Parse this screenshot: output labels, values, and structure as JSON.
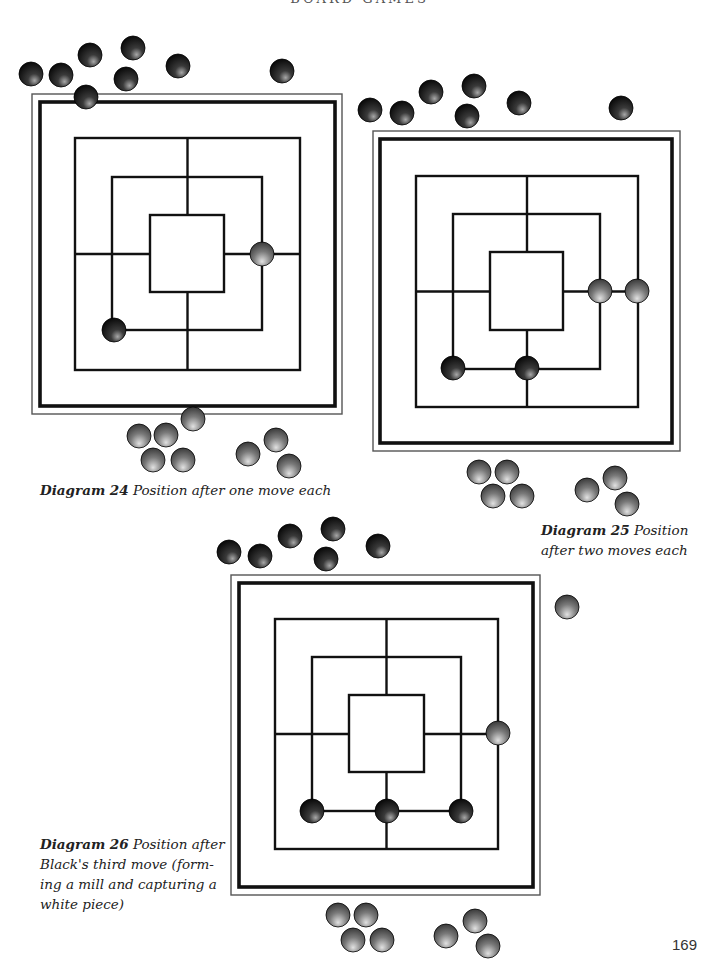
{
  "running_head": "BOARD GAMES",
  "page_number": "169",
  "colors": {
    "line": "#111111",
    "frame_thin": "#555555",
    "black_piece_base": "#0a0a0a",
    "black_piece_highlight": "#9a9a9a",
    "white_piece_base": "#3a3a3a",
    "white_piece_highlight": "#d8d8d8"
  },
  "diagrams": [
    {
      "id": "diagram-24",
      "caption_label": "Diagram 24",
      "caption_text": " Position after one move each",
      "caption_lines": [
        "Position after one move each"
      ],
      "frame_outer": [
        32,
        94,
        310,
        320
      ],
      "frame_inner": [
        40,
        102,
        295,
        304
      ],
      "squares": [
        [
          75,
          138,
          225,
          232
        ],
        [
          112,
          177,
          150,
          153
        ],
        [
          150,
          215,
          74,
          77
        ]
      ],
      "board_pieces": [
        {
          "color": "white",
          "x": 262,
          "y": 254
        },
        {
          "color": "black",
          "x": 114,
          "y": 330
        }
      ],
      "reserve_black": [
        [
          31,
          74
        ],
        [
          61,
          75
        ],
        [
          90,
          55
        ],
        [
          133,
          48
        ],
        [
          126,
          79
        ],
        [
          178,
          66
        ],
        [
          282,
          71
        ],
        [
          86,
          97
        ]
      ],
      "reserve_white": [
        [
          139,
          436
        ],
        [
          166,
          435
        ],
        [
          193,
          419
        ],
        [
          153,
          460
        ],
        [
          183,
          460
        ],
        [
          248,
          454
        ],
        [
          276,
          440
        ],
        [
          289,
          466
        ]
      ]
    },
    {
      "id": "diagram-25",
      "caption_label": "Diagram 25",
      "caption_text": " Position",
      "caption_line2": "after two moves each",
      "frame_outer": [
        373,
        131,
        307,
        320
      ],
      "frame_inner": [
        380,
        139,
        292,
        304
      ],
      "squares": [
        [
          416,
          176,
          222,
          231
        ],
        [
          453,
          214,
          147,
          155
        ],
        [
          490,
          252,
          73,
          78
        ]
      ],
      "board_pieces": [
        {
          "color": "white",
          "x": 600,
          "y": 291
        },
        {
          "color": "white",
          "x": 637,
          "y": 291
        },
        {
          "color": "black",
          "x": 453,
          "y": 368
        },
        {
          "color": "black",
          "x": 527,
          "y": 368
        }
      ],
      "reserve_black": [
        [
          370,
          110
        ],
        [
          402,
          113
        ],
        [
          431,
          92
        ],
        [
          474,
          86
        ],
        [
          467,
          116
        ],
        [
          519,
          103
        ],
        [
          621,
          108
        ]
      ],
      "reserve_white": [
        [
          479,
          472
        ],
        [
          507,
          472
        ],
        [
          493,
          496
        ],
        [
          522,
          496
        ],
        [
          587,
          490
        ],
        [
          615,
          478
        ],
        [
          627,
          504
        ]
      ]
    },
    {
      "id": "diagram-26",
      "caption_label": "Diagram 26",
      "caption_text": " Position after",
      "caption_line2": "Black's third move (form-",
      "caption_line3": "ing a mill and capturing a",
      "caption_line4": "white piece)",
      "frame_outer": [
        231,
        575,
        309,
        320
      ],
      "frame_inner": [
        239,
        583,
        294,
        304
      ],
      "squares": [
        [
          275,
          619,
          223,
          230
        ],
        [
          312,
          657,
          149,
          154
        ],
        [
          349,
          695,
          75,
          77
        ]
      ],
      "board_pieces": [
        {
          "color": "white",
          "x": 498,
          "y": 733
        },
        {
          "color": "black",
          "x": 312,
          "y": 811
        },
        {
          "color": "black",
          "x": 387,
          "y": 811
        },
        {
          "color": "black",
          "x": 461,
          "y": 811
        }
      ],
      "captured_white": [
        [
          567,
          607
        ]
      ],
      "reserve_black": [
        [
          229,
          552
        ],
        [
          260,
          556
        ],
        [
          290,
          536
        ],
        [
          333,
          529
        ],
        [
          326,
          559
        ],
        [
          378,
          546
        ]
      ],
      "reserve_white": [
        [
          338,
          915
        ],
        [
          366,
          915
        ],
        [
          353,
          940
        ],
        [
          382,
          940
        ],
        [
          446,
          936
        ],
        [
          475,
          921
        ],
        [
          488,
          946
        ]
      ]
    }
  ]
}
